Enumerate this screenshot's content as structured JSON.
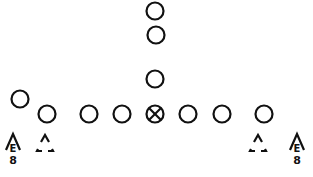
{
  "diagram": {
    "type": "football-formation",
    "stroke_color": "#111111",
    "background": "#ffffff",
    "offense": {
      "backfield": [
        {
          "id": "deep-back-1",
          "x": 155,
          "y": 11
        },
        {
          "id": "deep-back-2",
          "x": 156,
          "y": 35
        },
        {
          "id": "up-back",
          "x": 155,
          "y": 79
        }
      ],
      "wingback": {
        "id": "wing",
        "x": 20,
        "y": 99
      },
      "line": [
        {
          "id": "left-end",
          "x": 47,
          "y": 114
        },
        {
          "id": "left-tackle",
          "x": 89,
          "y": 114
        },
        {
          "id": "left-guard",
          "x": 122,
          "y": 114
        },
        {
          "id": "center",
          "x": 155,
          "y": 114,
          "marked": true
        },
        {
          "id": "right-guard",
          "x": 188,
          "y": 114
        },
        {
          "id": "right-tackle",
          "x": 222,
          "y": 114
        },
        {
          "id": "right-end",
          "x": 264,
          "y": 114
        }
      ]
    },
    "defense": {
      "triangles": [
        {
          "id": "left-defender",
          "x": 45,
          "y": 145
        },
        {
          "id": "right-defender",
          "x": 258,
          "y": 145
        }
      ],
      "ends": [
        {
          "id": "left-defensive-end",
          "x": 13,
          "y": 145,
          "letter": "E",
          "number": "8"
        },
        {
          "id": "right-defensive-end",
          "x": 297,
          "y": 145,
          "letter": "E",
          "number": "8"
        }
      ]
    }
  }
}
